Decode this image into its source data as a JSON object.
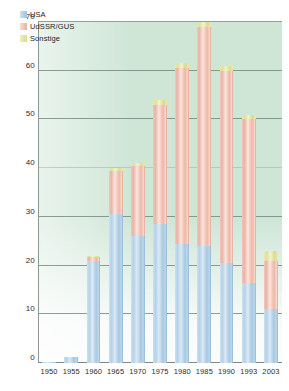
{
  "chart_data": {
    "type": "bar",
    "subtype": "stacked-column",
    "title": "",
    "xlabel": "",
    "ylabel": "",
    "ylim": [
      0,
      70
    ],
    "yticks": [
      0,
      10,
      20,
      30,
      40,
      50,
      60,
      70
    ],
    "grid": true,
    "legend_position": "top-left",
    "categories": [
      "1950",
      "1955",
      "1960",
      "1965",
      "1970",
      "1975",
      "1980",
      "1985",
      "1990",
      "1993",
      "2003"
    ],
    "series": [
      {
        "name": "USA",
        "color": "#b5d2e8",
        "values": [
          0.3,
          1.2,
          21.0,
          30.5,
          26.0,
          28.5,
          24.5,
          24.0,
          20.5,
          16.5,
          11.0
        ]
      },
      {
        "name": "UdSSR/GUS",
        "color": "#eab3a4",
        "values": [
          0.0,
          0.0,
          0.8,
          9.0,
          14.5,
          24.5,
          36.0,
          45.0,
          39.5,
          33.5,
          10.0
        ]
      },
      {
        "name": "Sonstige",
        "color": "#dfe09a",
        "values": [
          0.0,
          0.0,
          0.2,
          0.5,
          0.5,
          1.0,
          1.0,
          1.0,
          1.0,
          1.0,
          2.0
        ]
      }
    ],
    "totals": [
      0.3,
      1.2,
      22.0,
      40.0,
      41.0,
      54.0,
      61.5,
      70.0,
      61.0,
      51.0,
      23.0
    ]
  },
  "legend": {
    "items": [
      {
        "label": "USA",
        "swatch": "usa-swatch"
      },
      {
        "label": "UdSSR/GUS",
        "swatch": "udssr-swatch"
      },
      {
        "label": "Sonstige",
        "swatch": "sonstige-swatch"
      }
    ]
  },
  "colors": {
    "plot_background": "#cfe6d7",
    "gridline": "#6b7f74",
    "usa": "#b5d2e8",
    "udssr": "#eab3a4",
    "sonstige": "#dfe09a"
  }
}
